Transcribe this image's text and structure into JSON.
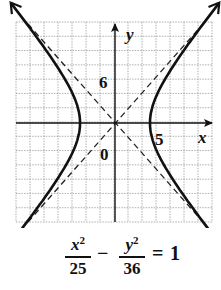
{
  "diagram": {
    "type": "hyperbola-graph",
    "axes": {
      "x_label": "x",
      "y_label": "y",
      "origin_label": "0",
      "x_tick_label": "5",
      "y_tick_label": "6"
    },
    "grid": {
      "cells_x": 14,
      "cells_y": 14,
      "units_per_cell": 2
    },
    "hyperbola": {
      "a": 5,
      "b": 6,
      "orientation": "horizontal",
      "center": [
        0,
        0
      ]
    },
    "asymptotes": [
      "y = 6/5 x",
      "y = -6/5 x"
    ],
    "colors": {
      "curve": "#111111",
      "grid": "#9a9a9a",
      "axis": "#111111",
      "background": "#ffffff"
    }
  },
  "equation": {
    "term1_numerator": "x",
    "term1_exponent": "2",
    "term1_denominator": "25",
    "operator": "−",
    "term2_numerator": "y",
    "term2_exponent": "2",
    "term2_denominator": "36",
    "equals": "=",
    "rhs": "1"
  }
}
